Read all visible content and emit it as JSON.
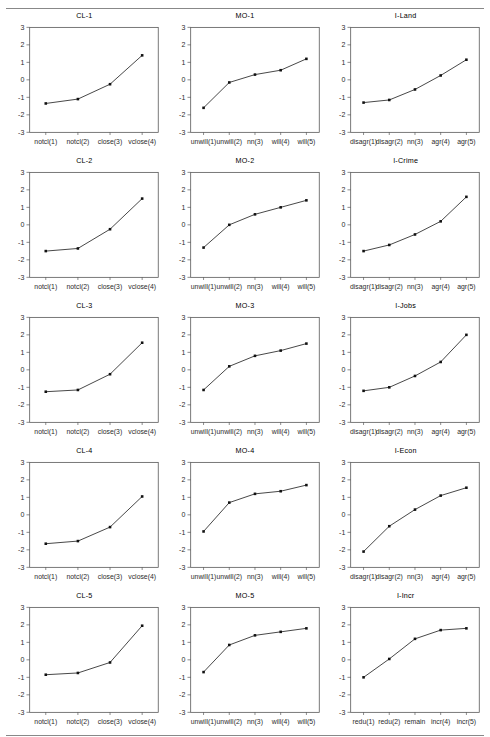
{
  "figure": {
    "rows": 5,
    "cols": 3,
    "y_ticks": [
      3,
      2,
      1,
      0,
      -1,
      -2,
      -3
    ],
    "y_tick_labels": [
      "3",
      "2",
      "1",
      "0",
      "-1",
      "-2",
      "-3"
    ],
    "ylim": [
      -3,
      3
    ],
    "grid": false,
    "legend": "none"
  },
  "chart_data": [
    {
      "type": "line",
      "title": "CL-1",
      "xlabel": "",
      "ylabel": "",
      "ylim": [
        -3,
        3
      ],
      "categories": [
        "notcl(1)",
        "notcl(2)",
        "close(3)",
        "vclose(4)"
      ],
      "values": [
        -1.35,
        -1.1,
        -0.25,
        1.4
      ]
    },
    {
      "type": "line",
      "title": "MO-1",
      "xlabel": "",
      "ylabel": "",
      "ylim": [
        -3,
        3
      ],
      "categories": [
        "unwill(1)",
        "unwill(2)",
        "nn(3)",
        "will(4)",
        "will(5)"
      ],
      "values": [
        -1.6,
        -0.15,
        0.3,
        0.55,
        1.2
      ]
    },
    {
      "type": "line",
      "title": "I-Land",
      "xlabel": "",
      "ylabel": "",
      "ylim": [
        -3,
        3
      ],
      "categories": [
        "disagr(1)",
        "disagr(2)",
        "nn(3)",
        "agr(4)",
        "agr(5)"
      ],
      "values": [
        -1.3,
        -1.15,
        -0.55,
        0.25,
        1.15
      ]
    },
    {
      "type": "line",
      "title": "CL-2",
      "xlabel": "",
      "ylabel": "",
      "ylim": [
        -3,
        3
      ],
      "categories": [
        "notcl(1)",
        "notcl(2)",
        "close(3)",
        "vclose(4)"
      ],
      "values": [
        -1.5,
        -1.35,
        -0.25,
        1.5
      ]
    },
    {
      "type": "line",
      "title": "MO-2",
      "xlabel": "",
      "ylabel": "",
      "ylim": [
        -3,
        3
      ],
      "categories": [
        "unwill(1)",
        "unwill(2)",
        "nn(3)",
        "will(4)",
        "will(5)"
      ],
      "values": [
        -1.3,
        0.0,
        0.6,
        1.0,
        1.4
      ]
    },
    {
      "type": "line",
      "title": "I-Crime",
      "xlabel": "",
      "ylabel": "",
      "ylim": [
        -3,
        3
      ],
      "categories": [
        "disagr(1)",
        "disagr(2)",
        "nn(3)",
        "agr(4)",
        "agr(5)"
      ],
      "values": [
        -1.5,
        -1.15,
        -0.55,
        0.2,
        1.6
      ]
    },
    {
      "type": "line",
      "title": "CL-3",
      "xlabel": "",
      "ylabel": "",
      "ylim": [
        -3,
        3
      ],
      "categories": [
        "notcl(1)",
        "notcl(2)",
        "close(3)",
        "vclose(4)"
      ],
      "values": [
        -1.25,
        -1.15,
        -0.25,
        1.55
      ]
    },
    {
      "type": "line",
      "title": "MO-3",
      "xlabel": "",
      "ylabel": "",
      "ylim": [
        -3,
        3
      ],
      "categories": [
        "unwill(1)",
        "unwill(2)",
        "nn(3)",
        "will(4)",
        "will(5)"
      ],
      "values": [
        -1.15,
        0.2,
        0.8,
        1.1,
        1.5
      ]
    },
    {
      "type": "line",
      "title": "I-Jobs",
      "xlabel": "",
      "ylabel": "",
      "ylim": [
        -3,
        3
      ],
      "categories": [
        "disagr(1)",
        "disagr(2)",
        "nn(3)",
        "agr(4)",
        "agr(5)"
      ],
      "values": [
        -1.2,
        -1.0,
        -0.35,
        0.45,
        2.0
      ]
    },
    {
      "type": "line",
      "title": "CL-4",
      "xlabel": "",
      "ylabel": "",
      "ylim": [
        -3,
        3
      ],
      "categories": [
        "notcl(1)",
        "notcl(2)",
        "close(3)",
        "vclose(4)"
      ],
      "values": [
        -1.65,
        -1.5,
        -0.7,
        1.05
      ]
    },
    {
      "type": "line",
      "title": "MO-4",
      "xlabel": "",
      "ylabel": "",
      "ylim": [
        -3,
        3
      ],
      "categories": [
        "unwill(1)",
        "unwill(2)",
        "nn(3)",
        "will(4)",
        "will(5)"
      ],
      "values": [
        -0.95,
        0.7,
        1.2,
        1.35,
        1.7
      ]
    },
    {
      "type": "line",
      "title": "I-Econ",
      "xlabel": "",
      "ylabel": "",
      "ylim": [
        -3,
        3
      ],
      "categories": [
        "disagr(1)",
        "disagr(2)",
        "nn(3)",
        "agr(4)",
        "agr(5)"
      ],
      "values": [
        -2.1,
        -0.65,
        0.3,
        1.1,
        1.55
      ]
    },
    {
      "type": "line",
      "title": "CL-5",
      "xlabel": "",
      "ylabel": "",
      "ylim": [
        -3,
        3
      ],
      "categories": [
        "notcl(1)",
        "notcl(2)",
        "close(3)",
        "vclose(4)"
      ],
      "values": [
        -0.85,
        -0.75,
        -0.15,
        1.95
      ]
    },
    {
      "type": "line",
      "title": "MO-5",
      "xlabel": "",
      "ylabel": "",
      "ylim": [
        -3,
        3
      ],
      "categories": [
        "unwill(1)",
        "unwill(2)",
        "nn(3)",
        "will(4)",
        "will(5)"
      ],
      "values": [
        -0.7,
        0.85,
        1.4,
        1.6,
        1.8
      ]
    },
    {
      "type": "line",
      "title": "I-Incr",
      "xlabel": "",
      "ylabel": "",
      "ylim": [
        -3,
        3
      ],
      "categories": [
        "redu(1)",
        "redu(2)",
        "remain",
        "incr(4)",
        "incr(5)"
      ],
      "values": [
        -1.0,
        0.05,
        1.2,
        1.7,
        1.8
      ]
    }
  ],
  "colors": {
    "line": "#1a1a1a",
    "marker": "#111111",
    "axis": "#4d4d4d",
    "text": "#2b2b2b",
    "rule": "#888888",
    "background": "#ffffff"
  }
}
